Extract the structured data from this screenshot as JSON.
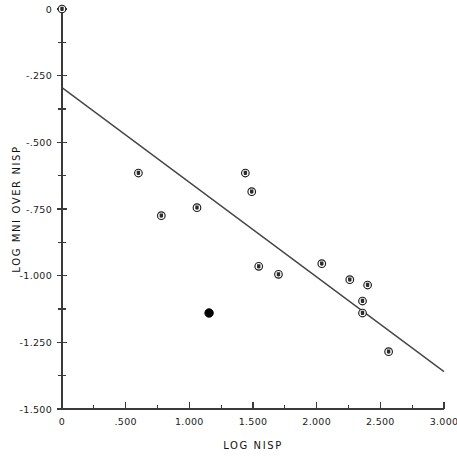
{
  "chart_data": {
    "type": "scatter",
    "title": "",
    "xlabel": "LOG NISP",
    "ylabel": "LOG MNI OVER NISP",
    "xlim": [
      0,
      3.0
    ],
    "ylim": [
      -1.5,
      0
    ],
    "grid": false,
    "legend": "none",
    "x_ticks": [
      0,
      0.5,
      1.0,
      1.5,
      2.0,
      2.5,
      3.0
    ],
    "x_ticklabels": [
      "0",
      ".500",
      "1.000",
      "1.500",
      "2.000",
      "2.500",
      "3.000"
    ],
    "x_minor_ticks": [
      0.25,
      0.75,
      1.25,
      1.75,
      2.25,
      2.75
    ],
    "y_ticks": [
      0,
      -0.25,
      -0.5,
      -0.75,
      -1.0,
      -1.25,
      -1.5
    ],
    "y_ticklabels": [
      "0",
      "-.250",
      "-.500",
      "-.750",
      "-1.000",
      "-1.250",
      "-1.500"
    ],
    "y_minor_ticks": [
      -0.125,
      -0.375,
      -0.625,
      -0.875,
      -1.125,
      -1.375
    ],
    "series": [
      {
        "name": "open-circle-observations",
        "marker": "open-circle",
        "points": [
          {
            "x": 0.0,
            "y": 0.0
          },
          {
            "x": 0.6,
            "y": -0.615
          },
          {
            "x": 0.78,
            "y": -0.775
          },
          {
            "x": 1.06,
            "y": -0.745
          },
          {
            "x": 1.44,
            "y": -0.615
          },
          {
            "x": 1.49,
            "y": -0.685
          },
          {
            "x": 1.545,
            "y": -0.965
          },
          {
            "x": 1.7,
            "y": -0.995
          },
          {
            "x": 2.04,
            "y": -0.955
          },
          {
            "x": 2.26,
            "y": -1.015
          },
          {
            "x": 2.4,
            "y": -1.035
          },
          {
            "x": 2.36,
            "y": -1.095
          },
          {
            "x": 2.36,
            "y": -1.14
          },
          {
            "x": 2.565,
            "y": -1.285
          }
        ]
      },
      {
        "name": "highlighted-observation",
        "marker": "filled-circle",
        "points": [
          {
            "x": 1.155,
            "y": -1.14
          }
        ]
      }
    ],
    "fit_line": {
      "name": "regression-line",
      "x0": 0.0,
      "y0": -0.295,
      "x1": 3.0,
      "y1": -1.36
    }
  }
}
